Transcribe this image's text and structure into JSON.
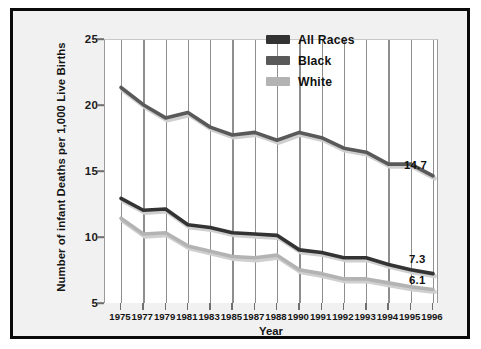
{
  "chart_data": {
    "type": "line",
    "title": "",
    "xlabel": "Year",
    "ylabel": "Number of infant Deaths per 1,000 Live Births",
    "grid": "vertical",
    "legend_position": "top-right",
    "ylim": [
      5,
      25
    ],
    "yticks": [
      5,
      10,
      15,
      20,
      25
    ],
    "categories": [
      "1975",
      "1977",
      "1979",
      "1981",
      "1983",
      "1985",
      "1987",
      "1988",
      "1990",
      "1991",
      "1992",
      "1993",
      "1994",
      "1995",
      "1996"
    ],
    "series": [
      {
        "name": "Black",
        "color": "#595959",
        "values": [
          21.4,
          20.1,
          19.1,
          19.5,
          18.4,
          17.8,
          18.0,
          17.4,
          18.0,
          17.6,
          16.8,
          16.5,
          15.6,
          15.6,
          14.7
        ],
        "end_label": "14.7"
      },
      {
        "name": "All Races",
        "color": "#333333",
        "values": [
          13.0,
          12.1,
          12.2,
          11.0,
          10.8,
          10.4,
          10.3,
          10.2,
          9.1,
          8.9,
          8.5,
          8.5,
          8.0,
          7.6,
          7.3
        ],
        "end_label": "7.3"
      },
      {
        "name": "White",
        "color": "#b3b3b3",
        "values": [
          11.5,
          10.3,
          10.4,
          9.4,
          9.0,
          8.6,
          8.5,
          8.7,
          7.6,
          7.3,
          6.9,
          6.9,
          6.6,
          6.3,
          6.1
        ],
        "end_label": "6.1"
      }
    ]
  },
  "legend": {
    "items": [
      {
        "label": "All Races",
        "color": "#333333"
      },
      {
        "label": "Black",
        "color": "#595959"
      },
      {
        "label": "White",
        "color": "#b3b3b3"
      }
    ]
  },
  "axes": {
    "y_title": "Number of infant Deaths per 1,000 Live Births",
    "x_title": "Year",
    "y_ticks": [
      "25",
      "20",
      "15",
      "10",
      "5"
    ],
    "x_ticks": [
      "1975",
      "1977",
      "1979",
      "1981",
      "1983",
      "1985",
      "1987",
      "1988",
      "1990",
      "1991",
      "1992",
      "1993",
      "1994",
      "1995",
      "1996"
    ]
  },
  "end_labels": {
    "black": "14.7",
    "all_races": "7.3",
    "white": "6.1"
  },
  "colors": {
    "frame": "#0a0a0a",
    "background": "#f1f1f1",
    "plot_background": "#ffffff",
    "gridline": "#8e8e8e",
    "all_races": "#333333",
    "black": "#595959",
    "white": "#b3b3b3"
  }
}
